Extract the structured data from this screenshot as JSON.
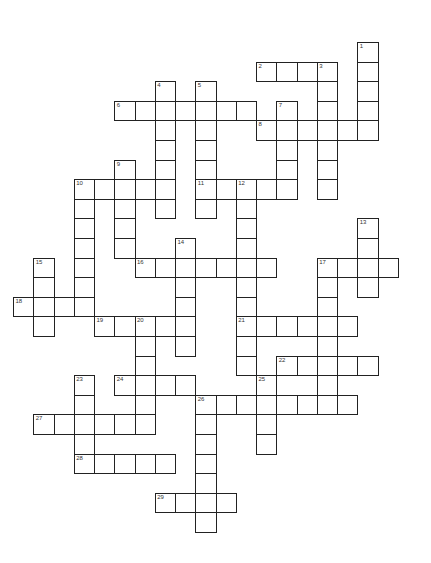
{
  "puzzle": {
    "type": "crossword",
    "layout": {
      "origin_x": 13,
      "origin_y": 42,
      "cell_w": 20.25,
      "cell_h": 19.6
    },
    "across": [
      {
        "number": "2",
        "row": 1,
        "col": 12,
        "length": 4
      },
      {
        "number": "6",
        "row": 3,
        "col": 5,
        "length": 7
      },
      {
        "number": "8",
        "row": 4,
        "col": 12,
        "length": 6
      },
      {
        "number": "10",
        "row": 7,
        "col": 3,
        "length": 5
      },
      {
        "number": "11",
        "row": 7,
        "col": 9,
        "length": 5
      },
      {
        "number": "16",
        "row": 11,
        "col": 6,
        "length": 7
      },
      {
        "number": "17",
        "row": 11,
        "col": 15,
        "length": 4
      },
      {
        "number": "18",
        "row": 13,
        "col": 0,
        "length": 4
      },
      {
        "number": "19",
        "row": 14,
        "col": 4,
        "length": 5
      },
      {
        "number": "21",
        "row": 14,
        "col": 11,
        "length": 6
      },
      {
        "number": "22",
        "row": 16,
        "col": 13,
        "length": 5
      },
      {
        "number": "24",
        "row": 17,
        "col": 5,
        "length": 4
      },
      {
        "number": "26",
        "row": 18,
        "col": 9,
        "length": 8
      },
      {
        "number": "27",
        "row": 19,
        "col": 1,
        "length": 6
      },
      {
        "number": "28",
        "row": 21,
        "col": 3,
        "length": 5
      },
      {
        "number": "29",
        "row": 23,
        "col": 7,
        "length": 4
      }
    ],
    "down": [
      {
        "number": "1",
        "row": 0,
        "col": 17,
        "length": 5
      },
      {
        "number": "3",
        "row": 1,
        "col": 15,
        "length": 7
      },
      {
        "number": "4",
        "row": 2,
        "col": 7,
        "length": 7
      },
      {
        "number": "5",
        "row": 2,
        "col": 9,
        "length": 7
      },
      {
        "number": "7",
        "row": 3,
        "col": 13,
        "length": 5
      },
      {
        "number": "9",
        "row": 6,
        "col": 5,
        "length": 5
      },
      {
        "number": "10",
        "row": 7,
        "col": 3,
        "length": 7
      },
      {
        "number": "12",
        "row": 7,
        "col": 11,
        "length": 10
      },
      {
        "number": "13",
        "row": 9,
        "col": 17,
        "length": 4
      },
      {
        "number": "14",
        "row": 10,
        "col": 8,
        "length": 6
      },
      {
        "number": "15",
        "row": 11,
        "col": 1,
        "length": 4
      },
      {
        "number": "17",
        "row": 11,
        "col": 15,
        "length": 8
      },
      {
        "number": "20",
        "row": 14,
        "col": 6,
        "length": 6
      },
      {
        "number": "23",
        "row": 17,
        "col": 3,
        "length": 5
      },
      {
        "number": "25",
        "row": 17,
        "col": 12,
        "length": 4
      },
      {
        "number": "26",
        "row": 18,
        "col": 9,
        "length": 7
      }
    ]
  }
}
